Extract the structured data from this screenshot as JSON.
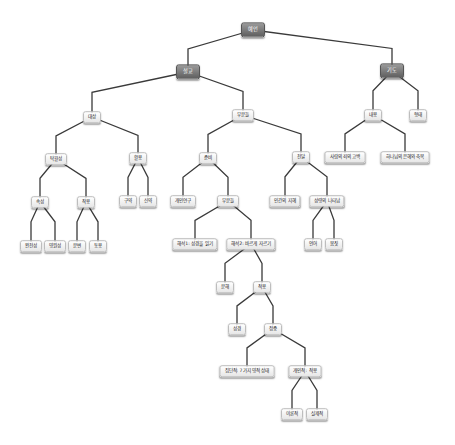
{
  "diagram": {
    "type": "tree",
    "title": "예언",
    "nodes": [
      {
        "id": "n0",
        "label": "예언",
        "x": 253,
        "y": 30,
        "style": "dark"
      },
      {
        "id": "n1",
        "label": "설교",
        "x": 188,
        "y": 72,
        "style": "dark"
      },
      {
        "id": "n2",
        "label": "기도",
        "x": 392,
        "y": 71,
        "style": "dark"
      },
      {
        "id": "n3",
        "label": "대상",
        "x": 92,
        "y": 117,
        "style": "light"
      },
      {
        "id": "n4",
        "label": "부분들",
        "x": 243,
        "y": 115,
        "style": "light"
      },
      {
        "id": "n5",
        "label": "내용",
        "x": 373,
        "y": 115,
        "style": "light"
      },
      {
        "id": "n6",
        "label": "형태",
        "x": 418,
        "y": 115,
        "style": "light"
      },
      {
        "id": "n7",
        "label": "탁월성",
        "x": 56,
        "y": 159,
        "style": "light"
      },
      {
        "id": "n8",
        "label": "활용",
        "x": 138,
        "y": 158,
        "style": "light"
      },
      {
        "id": "n9",
        "label": "준비",
        "x": 208,
        "y": 158,
        "style": "light"
      },
      {
        "id": "n10",
        "label": "전달",
        "x": 301,
        "y": 157,
        "style": "light"
      },
      {
        "id": "n11",
        "label": "사람의 죄의 고백",
        "x": 345,
        "y": 157,
        "style": "light"
      },
      {
        "id": "n12",
        "label": "하나님의 은혜와 축복",
        "x": 405,
        "y": 157,
        "style": "light"
      },
      {
        "id": "n13",
        "label": "속성",
        "x": 40,
        "y": 202,
        "style": "light"
      },
      {
        "id": "n14",
        "label": "작용",
        "x": 86,
        "y": 202,
        "style": "light"
      },
      {
        "id": "n15",
        "label": "구약",
        "x": 128,
        "y": 201,
        "style": "light"
      },
      {
        "id": "n16",
        "label": "신약",
        "x": 148,
        "y": 201,
        "style": "light"
      },
      {
        "id": "n17",
        "label": "개인연구",
        "x": 183,
        "y": 201,
        "style": "light"
      },
      {
        "id": "n18",
        "label": "부분들",
        "x": 228,
        "y": 201,
        "style": "light"
      },
      {
        "id": "n19",
        "label": "인간의 지혜",
        "x": 285,
        "y": 201,
        "style": "light"
      },
      {
        "id": "n20",
        "label": "성령의 나타남",
        "x": 327,
        "y": 201,
        "style": "light"
      },
      {
        "id": "n21",
        "label": "완전성",
        "x": 31,
        "y": 246,
        "style": "light"
      },
      {
        "id": "n22",
        "label": "영원성",
        "x": 55,
        "y": 246,
        "style": "light"
      },
      {
        "id": "n23",
        "label": "분변",
        "x": 77,
        "y": 246,
        "style": "light"
      },
      {
        "id": "n24",
        "label": "동용",
        "x": 98,
        "y": 246,
        "style": "light"
      },
      {
        "id": "n25",
        "label": "해석1: 성경을 읽기",
        "x": 195,
        "y": 244,
        "style": "light"
      },
      {
        "id": "n26",
        "label": "해석2: 바르게 자르기",
        "x": 251,
        "y": 244,
        "style": "light"
      },
      {
        "id": "n27",
        "label": "언어",
        "x": 313,
        "y": 244,
        "style": "light"
      },
      {
        "id": "n28",
        "label": "몸짓",
        "x": 334,
        "y": 244,
        "style": "light"
      },
      {
        "id": "n29",
        "label": "분해",
        "x": 225,
        "y": 287,
        "style": "light"
      },
      {
        "id": "n30",
        "label": "적용",
        "x": 262,
        "y": 287,
        "style": "light"
      },
      {
        "id": "n31",
        "label": "성경",
        "x": 237,
        "y": 329,
        "style": "light"
      },
      {
        "id": "n32",
        "label": "정중",
        "x": 273,
        "y": 329,
        "style": "light"
      },
      {
        "id": "n33",
        "label": "집단적: 7가지 영적 상태",
        "x": 247,
        "y": 371,
        "style": "light"
      },
      {
        "id": "n34",
        "label": "개인적: 적용",
        "x": 305,
        "y": 371,
        "style": "light"
      },
      {
        "id": "n35",
        "label": "이론적",
        "x": 292,
        "y": 414,
        "style": "light"
      },
      {
        "id": "n36",
        "label": "실제적",
        "x": 317,
        "y": 414,
        "style": "light"
      }
    ],
    "edges": [
      [
        "n0",
        "n1"
      ],
      [
        "n0",
        "n2"
      ],
      [
        "n1",
        "n3"
      ],
      [
        "n1",
        "n4"
      ],
      [
        "n2",
        "n5"
      ],
      [
        "n2",
        "n6"
      ],
      [
        "n3",
        "n7"
      ],
      [
        "n3",
        "n8"
      ],
      [
        "n4",
        "n9"
      ],
      [
        "n4",
        "n10"
      ],
      [
        "n5",
        "n11"
      ],
      [
        "n5",
        "n12"
      ],
      [
        "n7",
        "n13"
      ],
      [
        "n7",
        "n14"
      ],
      [
        "n8",
        "n15"
      ],
      [
        "n8",
        "n16"
      ],
      [
        "n9",
        "n17"
      ],
      [
        "n9",
        "n18"
      ],
      [
        "n10",
        "n19"
      ],
      [
        "n10",
        "n20"
      ],
      [
        "n13",
        "n21"
      ],
      [
        "n13",
        "n22"
      ],
      [
        "n14",
        "n23"
      ],
      [
        "n14",
        "n24"
      ],
      [
        "n18",
        "n25"
      ],
      [
        "n18",
        "n26"
      ],
      [
        "n20",
        "n27"
      ],
      [
        "n20",
        "n28"
      ],
      [
        "n26",
        "n29"
      ],
      [
        "n26",
        "n30"
      ],
      [
        "n30",
        "n31"
      ],
      [
        "n30",
        "n32"
      ],
      [
        "n32",
        "n33"
      ],
      [
        "n32",
        "n34"
      ],
      [
        "n34",
        "n35"
      ],
      [
        "n34",
        "n36"
      ]
    ],
    "colors": {
      "edge": "#3a3a3a",
      "dark_node": "#6e6e6e",
      "light_node": "#f7f7f7",
      "background": "#ffffff"
    }
  }
}
